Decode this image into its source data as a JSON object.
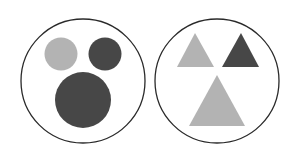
{
  "figure": {
    "background": "#ffffff",
    "panels": [
      {
        "id": "circles",
        "outline": {
          "cx": 83,
          "cy": 81,
          "r": 62,
          "stroke": "#2a2a2a"
        },
        "shapes": [
          {
            "type": "circle",
            "name": "small-light-circle",
            "cx": 61,
            "cy": 54,
            "r": 16.5,
            "fill": "#b3b3b3"
          },
          {
            "type": "circle",
            "name": "small-dark-circle",
            "cx": 105,
            "cy": 54,
            "r": 16.5,
            "fill": "#474747"
          },
          {
            "type": "circle",
            "name": "large-dark-circle",
            "cx": 83,
            "cy": 100,
            "r": 28,
            "fill": "#474747"
          }
        ]
      },
      {
        "id": "triangles",
        "outline": {
          "cx": 217,
          "cy": 81,
          "r": 62,
          "stroke": "#2a2a2a"
        },
        "shapes": [
          {
            "type": "triangle",
            "name": "small-light-triangle",
            "points": "195,33 177,67 214,67",
            "fill": "#b3b3b3"
          },
          {
            "type": "triangle",
            "name": "small-dark-triangle",
            "points": "241,33 222,67 259,67",
            "fill": "#474747"
          },
          {
            "type": "triangle",
            "name": "large-light-triangle",
            "points": "217,75 189,126 245,126",
            "fill": "#b3b3b3"
          }
        ]
      }
    ]
  }
}
